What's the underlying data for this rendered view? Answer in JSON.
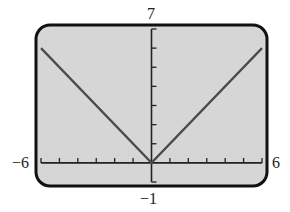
{
  "chart_data": {
    "type": "line",
    "title": "",
    "xlabel": "",
    "ylabel": "",
    "xlim": [
      -6,
      6
    ],
    "ylim": [
      -1,
      7
    ],
    "xscale": 1,
    "yscale": 1,
    "grid": false,
    "legend": null,
    "function": "y = |x|",
    "series": [
      {
        "name": "y = |x|",
        "x": [
          -6,
          0,
          6
        ],
        "y": [
          6,
          0,
          6
        ]
      }
    ],
    "window_labels": {
      "xmin": "−6",
      "xmax": "6",
      "ymin": "−1",
      "ymax": "7"
    },
    "x_ticks": [
      -6,
      -5,
      -4,
      -3,
      -2,
      -1,
      0,
      1,
      2,
      3,
      4,
      5,
      6
    ],
    "y_ticks": [
      -1,
      0,
      1,
      2,
      3,
      4,
      5,
      6,
      7
    ]
  },
  "colors": {
    "screen_bg": "#d6d6d6",
    "frame": "#111111",
    "axis": "#222222",
    "curve": "#4a4a4a"
  }
}
